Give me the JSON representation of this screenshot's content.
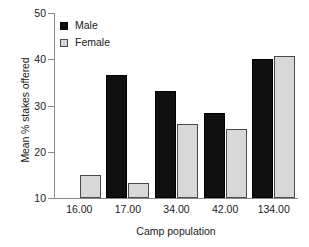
{
  "chart_data": {
    "type": "bar",
    "title": "",
    "xlabel": "Camp population",
    "ylabel": "Mean % stakes offered",
    "categories": [
      "16.00",
      "17.00",
      "34.00",
      "42.00",
      "134.00"
    ],
    "series": [
      {
        "name": "Male",
        "color": "#101010",
        "values": [
          null,
          36.7,
          33.2,
          28.4,
          40.1
        ]
      },
      {
        "name": "Female",
        "color": "#d8d8d8",
        "values": [
          14.9,
          13.3,
          26.0,
          25.0,
          40.7
        ]
      }
    ],
    "ylim": [
      10,
      50
    ],
    "yticks": [
      10,
      20,
      30,
      40,
      50
    ],
    "ytick_labels": [
      "10",
      "20",
      "30",
      "40",
      "50"
    ],
    "grid": false,
    "legend_position": "top-left-inside"
  },
  "legend": {
    "items": [
      {
        "label": "Male"
      },
      {
        "label": "Female"
      }
    ]
  },
  "axes": {
    "y_title": "Mean % stakes offered",
    "x_title": "Camp population"
  }
}
